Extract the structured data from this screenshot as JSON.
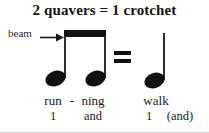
{
  "diagram": {
    "title": "2 quavers = 1 crotchet",
    "callout": {
      "label": "beam",
      "arrow_icon": "right-arrow-icon"
    },
    "colors": {
      "ink": "#111111",
      "text": "#1a1a1a",
      "background": "#ffffff",
      "stem": "#2e2e2e"
    },
    "notation": {
      "left_group": {
        "name": "beamed-quaver-pair",
        "note_count": 2,
        "note_value": "quaver",
        "beamed": true
      },
      "operator": "=",
      "right_group": {
        "name": "crotchet",
        "note_count": 1,
        "note_value": "crotchet",
        "beamed": false
      }
    },
    "words": {
      "run": "run",
      "hyphen": "-",
      "ning": "ning",
      "walk": "walk"
    },
    "counts": {
      "quaver_beat": "1",
      "quaver_offbeat": "and",
      "crotchet_beat": "1",
      "crotchet_offbeat": "(and)"
    }
  }
}
